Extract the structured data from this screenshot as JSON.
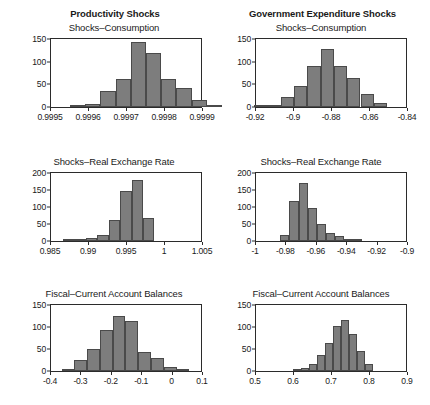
{
  "figure": {
    "column_headers": [
      "Productivity Shocks",
      "Government Expenditure Shocks"
    ],
    "bar_color": "#7d7d7d",
    "bar_edge_color": "#4a4a4a",
    "axis_color": "#2b2b2b",
    "background": "#ffffff"
  },
  "chart_data": [
    {
      "type": "bar",
      "title": "Shocks–Consumption",
      "panel": "top-left",
      "group": "Productivity Shocks",
      "xlabel": "",
      "ylabel": "",
      "xlim": [
        0.9995,
        0.9999
      ],
      "ylim": [
        0,
        150
      ],
      "grid": false,
      "legend": null,
      "xticks": [
        "0.9995",
        "0.9996",
        "0.9997",
        "0.9998",
        "0.9999"
      ],
      "xtick_values": [
        0.9995,
        0.9996,
        0.9997,
        0.9998,
        0.9999
      ],
      "yticks": [
        "0",
        "50",
        "100",
        "150"
      ],
      "ytick_values": [
        0,
        50,
        100,
        150
      ],
      "bin_edges": [
        0.99955,
        0.99959,
        0.99963,
        0.99967,
        0.99971,
        0.99975,
        0.99979,
        0.99983,
        0.99987,
        0.99991,
        0.99995
      ],
      "categories": [
        "0.99957",
        "0.99961",
        "0.99965",
        "0.99969",
        "0.99973",
        "0.99977",
        "0.99981",
        "0.99985",
        "0.99989",
        "0.99993"
      ],
      "values": [
        3,
        7,
        35,
        62,
        143,
        119,
        61,
        41,
        16,
        2
      ]
    },
    {
      "type": "bar",
      "title": "Shocks–Consumption",
      "panel": "top-right",
      "group": "Government Expenditure Shocks",
      "xlabel": "",
      "ylabel": "",
      "xlim": [
        -0.92,
        -0.84
      ],
      "ylim": [
        0,
        150
      ],
      "grid": false,
      "legend": null,
      "xticks": [
        "-0.92",
        "-0.9",
        "-0.88",
        "-0.86",
        "-0.84"
      ],
      "xtick_values": [
        -0.92,
        -0.9,
        -0.88,
        -0.86,
        -0.84
      ],
      "yticks": [
        "0",
        "50",
        "100",
        "150"
      ],
      "ytick_values": [
        0,
        50,
        100,
        150
      ],
      "bin_edges": [
        -0.921,
        -0.914,
        -0.907,
        -0.9,
        -0.893,
        -0.886,
        -0.879,
        -0.872,
        -0.865,
        -0.858,
        -0.851
      ],
      "categories": [
        "-0.9175",
        "-0.9105",
        "-0.9035",
        "-0.8965",
        "-0.8895",
        "-0.8825",
        "-0.8755",
        "-0.8685",
        "-0.8615",
        "-0.8545"
      ],
      "values": [
        3,
        5,
        23,
        47,
        90,
        129,
        90,
        63,
        29,
        9
      ]
    },
    {
      "type": "bar",
      "title": "Shocks–Real Exchange Rate",
      "panel": "middle-left",
      "group": "Productivity Shocks",
      "xlabel": "",
      "ylabel": "",
      "xlim": [
        0.985,
        1.005
      ],
      "ylim": [
        0,
        200
      ],
      "grid": false,
      "legend": null,
      "xticks": [
        "0.985",
        "0.99",
        "0.995",
        "1",
        "1.005"
      ],
      "xtick_values": [
        0.985,
        0.99,
        0.995,
        1.0,
        1.005
      ],
      "yticks": [
        "0",
        "50",
        "100",
        "150",
        "200"
      ],
      "ytick_values": [
        0,
        50,
        100,
        150,
        200
      ],
      "bin_edges": [
        0.9866,
        0.9881,
        0.9896,
        0.9911,
        0.9926,
        0.9941,
        0.9956,
        0.9971,
        0.9986
      ],
      "categories": [
        "0.98735",
        "0.98885",
        "0.99035",
        "0.99185",
        "0.99335",
        "0.99485",
        "0.99635",
        "0.99785"
      ],
      "values": [
        1,
        1,
        10,
        19,
        62,
        147,
        179,
        68
      ]
    },
    {
      "type": "bar",
      "title": "Shocks–Real Exchange Rate",
      "panel": "middle-right",
      "group": "Government Expenditure Shocks",
      "xlabel": "",
      "ylabel": "",
      "xlim": [
        -1.0,
        -0.9
      ],
      "ylim": [
        0,
        200
      ],
      "grid": false,
      "legend": null,
      "xticks": [
        "-1",
        "-0.98",
        "-0.96",
        "-0.94",
        "-0.92",
        "-0.9"
      ],
      "xtick_values": [
        -1.0,
        -0.98,
        -0.96,
        -0.94,
        -0.92,
        -0.9
      ],
      "yticks": [
        "0",
        "50",
        "100",
        "150",
        "200"
      ],
      "ytick_values": [
        0,
        50,
        100,
        150,
        200
      ],
      "bin_edges": [
        -0.984,
        -0.978,
        -0.972,
        -0.966,
        -0.96,
        -0.954,
        -0.948,
        -0.942,
        -0.936,
        -0.93
      ],
      "categories": [
        "-0.981",
        "-0.975",
        "-0.969",
        "-0.963",
        "-0.957",
        "-0.951",
        "-0.945",
        "-0.939",
        "-0.933"
      ],
      "values": [
        18,
        117,
        172,
        97,
        50,
        24,
        15,
        7,
        2
      ]
    },
    {
      "type": "bar",
      "title": "Fiscal–Current Account Balances",
      "panel": "bottom-left",
      "group": "Productivity Shocks",
      "xlabel": "",
      "ylabel": "",
      "xlim": [
        -0.4,
        0.1
      ],
      "ylim": [
        0,
        150
      ],
      "grid": false,
      "legend": null,
      "xticks": [
        "-0.4",
        "-0.3",
        "-0.2",
        "-0.1",
        "0",
        "0.1"
      ],
      "xtick_values": [
        -0.4,
        -0.3,
        -0.2,
        -0.1,
        0.0,
        0.1
      ],
      "yticks": [
        "0",
        "50",
        "100",
        "150"
      ],
      "ytick_values": [
        0,
        50,
        100,
        150
      ],
      "bin_edges": [
        -0.365,
        -0.323,
        -0.281,
        -0.239,
        -0.197,
        -0.155,
        -0.113,
        -0.071,
        -0.029,
        0.013,
        0.055
      ],
      "categories": [
        "-0.344",
        "-0.302",
        "-0.260",
        "-0.218",
        "-0.176",
        "-0.134",
        "-0.092",
        "-0.050",
        "-0.008",
        "0.034"
      ],
      "values": [
        3,
        25,
        51,
        94,
        124,
        114,
        44,
        29,
        8,
        4
      ]
    },
    {
      "type": "bar",
      "title": "Fiscal–Current Account Balances",
      "panel": "bottom-right",
      "group": "Government Expenditure Shocks",
      "xlabel": "",
      "ylabel": "",
      "xlim": [
        0.5,
        0.9
      ],
      "ylim": [
        0,
        150
      ],
      "grid": false,
      "legend": null,
      "xticks": [
        "0.5",
        "0.6",
        "0.7",
        "0.8",
        "0.9"
      ],
      "xtick_values": [
        0.5,
        0.6,
        0.7,
        0.8,
        0.9
      ],
      "yticks": [
        "0",
        "50",
        "100",
        "150"
      ],
      "ytick_values": [
        0,
        50,
        100,
        150
      ],
      "bin_edges": [
        0.598,
        0.619,
        0.64,
        0.661,
        0.682,
        0.703,
        0.724,
        0.745,
        0.766,
        0.787,
        0.808
      ],
      "categories": [
        "0.6085",
        "0.6295",
        "0.6505",
        "0.6715",
        "0.6925",
        "0.7135",
        "0.7345",
        "0.7555",
        "0.7765",
        "0.7975"
      ],
      "values": [
        2,
        7,
        16,
        37,
        64,
        103,
        117,
        85,
        46,
        16
      ]
    }
  ]
}
